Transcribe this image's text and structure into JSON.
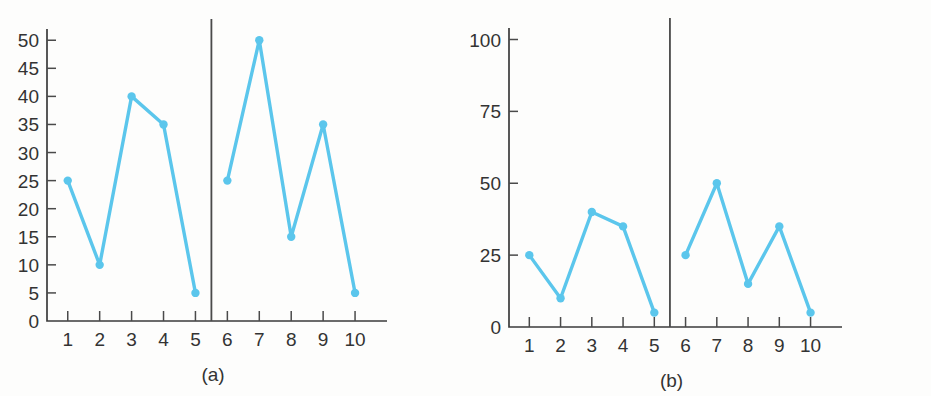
{
  "figure": {
    "background_color": "#fdfdfc",
    "axis_color": "#3b3b3b",
    "series_color": "#5bc6ec",
    "panels": [
      {
        "key": "a",
        "caption": "(a)",
        "chart_data": {
          "type": "line",
          "title": "",
          "subtitle": "",
          "xlabel": "",
          "ylabel": "",
          "x": [
            1,
            2,
            3,
            4,
            5,
            6,
            7,
            8,
            9,
            10
          ],
          "values": [
            25,
            10,
            40,
            35,
            5,
            25,
            50,
            15,
            35,
            5
          ],
          "series": [
            {
              "name": "segment-1-5",
              "x": [
                1,
                2,
                3,
                4,
                5
              ],
              "values": [
                25,
                10,
                40,
                35,
                5
              ]
            },
            {
              "name": "segment-6-10",
              "x": [
                6,
                7,
                8,
                9,
                10
              ],
              "values": [
                25,
                50,
                15,
                35,
                5
              ]
            }
          ],
          "xlim": [
            0.35,
            10.75
          ],
          "ylim": [
            0,
            52
          ],
          "xticks": [
            1,
            2,
            3,
            4,
            5,
            6,
            7,
            8,
            9,
            10
          ],
          "xtick_labels": [
            "1",
            "2",
            "3",
            "4",
            "5",
            "6",
            "7",
            "8",
            "9",
            "10"
          ],
          "yticks": [
            0,
            5,
            10,
            15,
            20,
            25,
            30,
            35,
            40,
            45,
            50
          ],
          "ytick_labels": [
            "0",
            "5",
            "10",
            "15",
            "20",
            "25",
            "30",
            "35",
            "40",
            "45",
            "50"
          ],
          "grid": false,
          "legend": "none",
          "annotations": [
            {
              "name": "group-divider",
              "type": "vertical-line",
              "x": 5.5
            }
          ]
        }
      },
      {
        "key": "b",
        "caption": "(b)",
        "chart_data": {
          "type": "line",
          "title": "",
          "subtitle": "",
          "xlabel": "",
          "ylabel": "",
          "x": [
            1,
            2,
            3,
            4,
            5,
            6,
            7,
            8,
            9,
            10
          ],
          "values": [
            25,
            10,
            40,
            35,
            5,
            25,
            50,
            15,
            35,
            5
          ],
          "series": [
            {
              "name": "segment-1-5",
              "x": [
                1,
                2,
                3,
                4,
                5
              ],
              "values": [
                25,
                10,
                40,
                35,
                5
              ]
            },
            {
              "name": "segment-6-10",
              "x": [
                6,
                7,
                8,
                9,
                10
              ],
              "values": [
                25,
                50,
                15,
                35,
                5
              ]
            }
          ],
          "xlim": [
            0.35,
            10.75
          ],
          "ylim": [
            0,
            104
          ],
          "xticks": [
            1,
            2,
            3,
            4,
            5,
            6,
            7,
            8,
            9,
            10
          ],
          "xtick_labels": [
            "1",
            "2",
            "3",
            "4",
            "5",
            "6",
            "7",
            "8",
            "9",
            "10"
          ],
          "yticks": [
            0,
            25,
            50,
            75,
            100
          ],
          "ytick_labels": [
            "0",
            "25",
            "50",
            "75",
            "100"
          ],
          "grid": false,
          "legend": "none",
          "annotations": [
            {
              "name": "group-divider",
              "type": "vertical-line",
              "x": 5.5
            }
          ]
        }
      }
    ]
  },
  "chart_data": [
    {
      "type": "line",
      "title": "(a)",
      "x": [
        1,
        2,
        3,
        4,
        5,
        6,
        7,
        8,
        9,
        10
      ],
      "values": [
        25,
        10,
        40,
        35,
        5,
        25,
        50,
        15,
        35,
        5
      ],
      "xlabel": "",
      "ylabel": "",
      "ylim": [
        0,
        52
      ],
      "xlim": [
        0.35,
        10.75
      ],
      "yticks": [
        0,
        5,
        10,
        15,
        20,
        25,
        30,
        35,
        40,
        45,
        50
      ],
      "xticks": [
        1,
        2,
        3,
        4,
        5,
        6,
        7,
        8,
        9,
        10
      ],
      "grid": false,
      "legend": "none"
    },
    {
      "type": "line",
      "title": "(b)",
      "x": [
        1,
        2,
        3,
        4,
        5,
        6,
        7,
        8,
        9,
        10
      ],
      "values": [
        25,
        10,
        40,
        35,
        5,
        25,
        50,
        15,
        35,
        5
      ],
      "xlabel": "",
      "ylabel": "",
      "ylim": [
        0,
        104
      ],
      "xlim": [
        0.35,
        10.75
      ],
      "yticks": [
        0,
        25,
        50,
        75,
        100
      ],
      "xticks": [
        1,
        2,
        3,
        4,
        5,
        6,
        7,
        8,
        9,
        10
      ],
      "grid": false,
      "legend": "none"
    }
  ]
}
